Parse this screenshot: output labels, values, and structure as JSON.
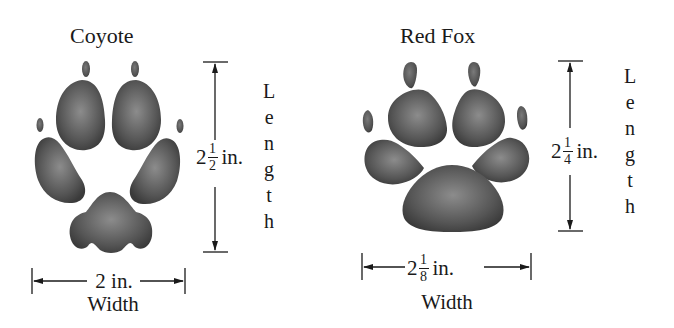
{
  "figure": {
    "prints": [
      {
        "id": "coyote",
        "title": "Coyote",
        "length": {
          "whole": "2",
          "numerator": "1",
          "denominator": "2",
          "unit": "in.",
          "value_in": 2.5
        },
        "length_word": [
          "L",
          "e",
          "n",
          "g",
          "t",
          "h"
        ],
        "width": {
          "text": "2 in.",
          "value_in": 2.0
        },
        "width_word": "Width"
      },
      {
        "id": "red-fox",
        "title": "Red Fox",
        "length": {
          "whole": "2",
          "numerator": "1",
          "denominator": "4",
          "unit": "in.",
          "value_in": 2.25
        },
        "length_word": [
          "L",
          "e",
          "n",
          "g",
          "t",
          "h"
        ],
        "width": {
          "whole": "2",
          "numerator": "1",
          "denominator": "8",
          "unit": "in.",
          "value_in": 2.125
        },
        "width_word": "Width"
      }
    ],
    "colors": {
      "pad": "#4a4a4a",
      "pad_light": "#8a8a8a",
      "line": "#1a1a1a",
      "background": "#ffffff"
    }
  }
}
